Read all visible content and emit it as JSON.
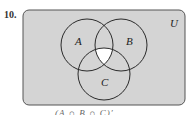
{
  "problem_number": "10.",
  "universe_label": "U",
  "sets": [
    {
      "label": "A",
      "cx": 87,
      "cy": 45,
      "r": 26
    },
    {
      "label": "B",
      "cx": 121,
      "cy": 45,
      "r": 26
    },
    {
      "label": "C",
      "cx": 104,
      "cy": 74,
      "r": 26
    }
  ],
  "colors": {
    "shaded": "#d4d4d4",
    "unshaded": "#ffffff",
    "stroke": "#2a2a2a",
    "box": "#555555"
  },
  "shaded_region": "complement of A ∩ B ∩ C (all except triple intersection)",
  "caption": "(A ∩ B ∩ C)′"
}
